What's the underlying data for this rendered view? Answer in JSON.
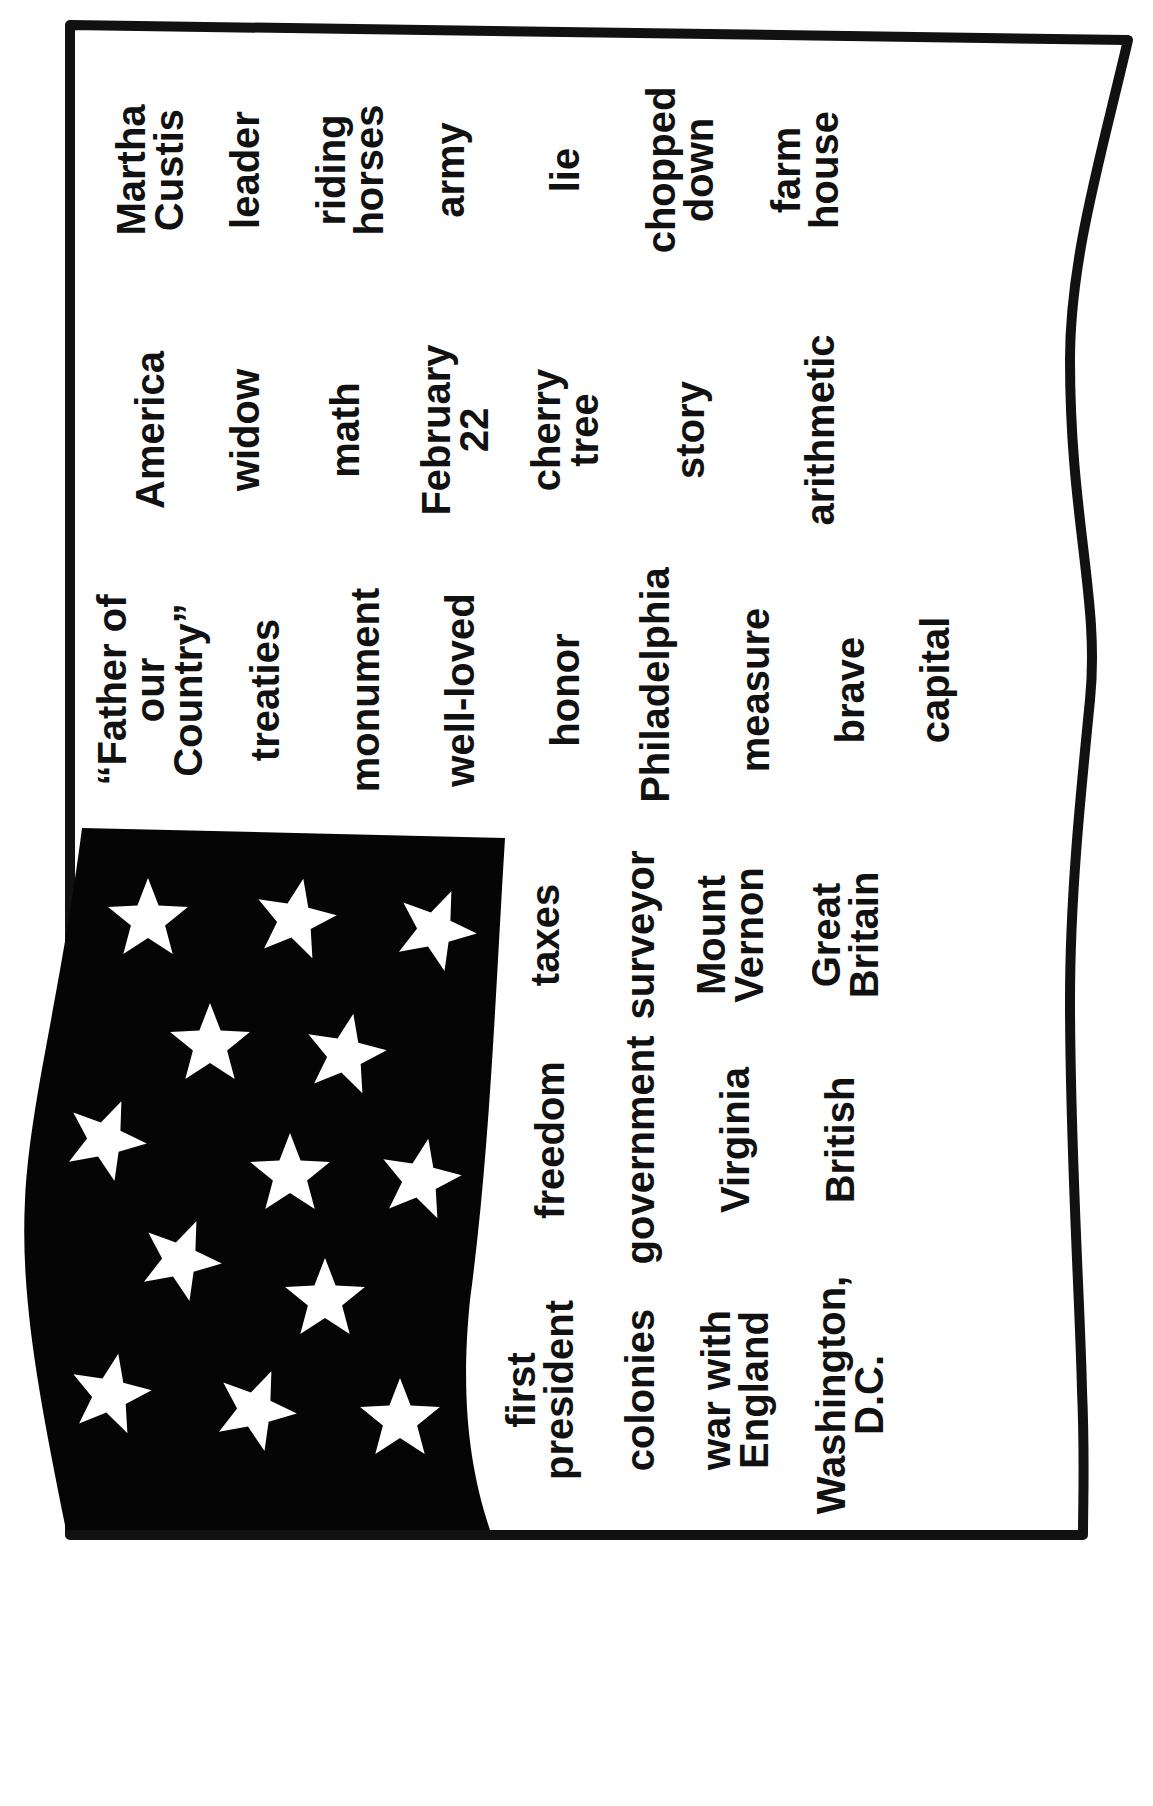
{
  "worksheet": {
    "title": "George Washington word flag",
    "colors": {
      "ink": "#111111",
      "canton": "#050505",
      "paper": "#ffffff",
      "star": "#ffffff"
    },
    "upper_field_words": [
      {
        "text": "Martha\nCustis",
        "x": 150,
        "y": 170
      },
      {
        "text": "America",
        "x": 150,
        "y": 430
      },
      {
        "text": "“Father of\nour\nCountry”",
        "x": 150,
        "y": 690
      },
      {
        "text": "leader",
        "x": 245,
        "y": 170
      },
      {
        "text": "widow",
        "x": 245,
        "y": 430
      },
      {
        "text": "treaties",
        "x": 265,
        "y": 690
      },
      {
        "text": "riding\nhorses",
        "x": 350,
        "y": 170
      },
      {
        "text": "math",
        "x": 345,
        "y": 430
      },
      {
        "text": "monument",
        "x": 365,
        "y": 690
      },
      {
        "text": "army",
        "x": 450,
        "y": 170
      },
      {
        "text": "February\n22",
        "x": 455,
        "y": 430
      },
      {
        "text": "well-loved",
        "x": 460,
        "y": 690
      },
      {
        "text": "lie",
        "x": 565,
        "y": 170
      },
      {
        "text": "cherry\ntree",
        "x": 565,
        "y": 430
      },
      {
        "text": "honor",
        "x": 565,
        "y": 690
      },
      {
        "text": "chopped\ndown",
        "x": 680,
        "y": 170
      },
      {
        "text": "story",
        "x": 690,
        "y": 430
      },
      {
        "text": "Philadelphia",
        "x": 655,
        "y": 685
      },
      {
        "text": "farm\nhouse",
        "x": 805,
        "y": 170
      },
      {
        "text": "arithmetic",
        "x": 820,
        "y": 430
      },
      {
        "text": "measure",
        "x": 755,
        "y": 690
      },
      {
        "text": "brave",
        "x": 850,
        "y": 690
      },
      {
        "text": "capital",
        "x": 935,
        "y": 680
      }
    ],
    "lower_field_words": [
      {
        "text": "taxes",
        "x": 545,
        "y": 935
      },
      {
        "text": "freedom",
        "x": 550,
        "y": 1140
      },
      {
        "text": "first\npresident",
        "x": 540,
        "y": 1390
      },
      {
        "text": "surveyor",
        "x": 640,
        "y": 935
      },
      {
        "text": "government",
        "x": 640,
        "y": 1150
      },
      {
        "text": "colonies",
        "x": 640,
        "y": 1390
      },
      {
        "text": "Mount\nVernon",
        "x": 730,
        "y": 935
      },
      {
        "text": "Virginia",
        "x": 735,
        "y": 1140
      },
      {
        "text": "war with\nEngland",
        "x": 735,
        "y": 1390
      },
      {
        "text": "Great\nBritain",
        "x": 845,
        "y": 935
      },
      {
        "text": "British",
        "x": 840,
        "y": 1140
      },
      {
        "text": "Washington,\nD.C.",
        "x": 850,
        "y": 1395
      }
    ],
    "stars": [
      {
        "x": 148,
        "y": 920
      },
      {
        "x": 295,
        "y": 920
      },
      {
        "x": 435,
        "y": 930
      },
      {
        "x": 210,
        "y": 1045
      },
      {
        "x": 345,
        "y": 1055
      },
      {
        "x": 105,
        "y": 1140
      },
      {
        "x": 290,
        "y": 1175
      },
      {
        "x": 420,
        "y": 1180
      },
      {
        "x": 180,
        "y": 1260
      },
      {
        "x": 325,
        "y": 1300
      },
      {
        "x": 110,
        "y": 1395
      },
      {
        "x": 255,
        "y": 1410
      },
      {
        "x": 400,
        "y": 1420
      }
    ]
  }
}
